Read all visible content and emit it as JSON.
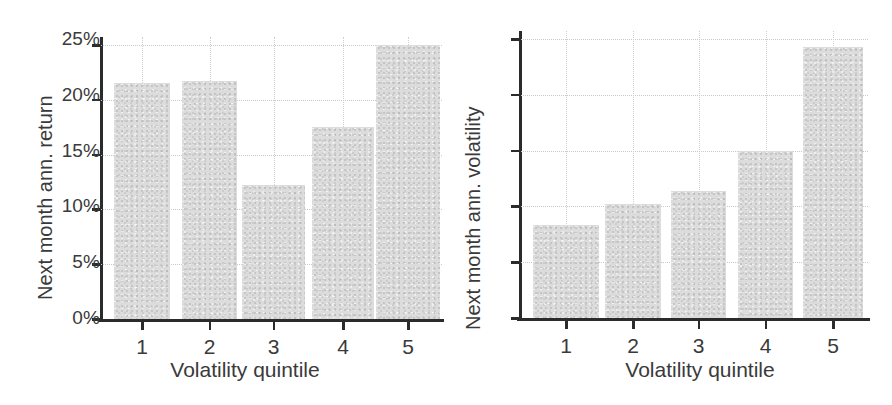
{
  "chart_data": [
    {
      "type": "bar",
      "panel": "left",
      "title": "",
      "xlabel": "Volatility quintile",
      "ylabel": "Next month ann. return",
      "categories": [
        "1",
        "2",
        "3",
        "4",
        "5"
      ],
      "values": [
        8.6,
        8.7,
        4.9,
        7.0,
        10.0
      ],
      "ylim": [
        0,
        10
      ],
      "ytick_values": [
        0,
        2,
        4,
        6,
        8,
        10
      ],
      "ytick_labels": [
        "0%",
        "2%",
        "4%",
        "6%",
        "8%",
        "10%"
      ],
      "grid": true,
      "legend": "none",
      "bar_color": "#dcdcdc",
      "axis_color": "#2b2b2b",
      "grid_color": "#c9c9c9"
    },
    {
      "type": "bar",
      "panel": "right",
      "title": "",
      "xlabel": "Volatility quintile",
      "ylabel": "Next month ann. volatility",
      "categories": [
        "1",
        "2",
        "3",
        "4",
        "5"
      ],
      "values": [
        8.3,
        10.2,
        11.4,
        15.0,
        24.3
      ],
      "ylim": [
        0,
        25
      ],
      "ytick_values": [
        0,
        5,
        10,
        15,
        20,
        25
      ],
      "ytick_labels": [
        "0%",
        "5%",
        "10%",
        "15%",
        "20%",
        "25%"
      ],
      "grid": true,
      "legend": "none",
      "bar_color": "#dcdcdc",
      "axis_color": "#2b2b2b",
      "grid_color": "#c9c9c9"
    }
  ]
}
